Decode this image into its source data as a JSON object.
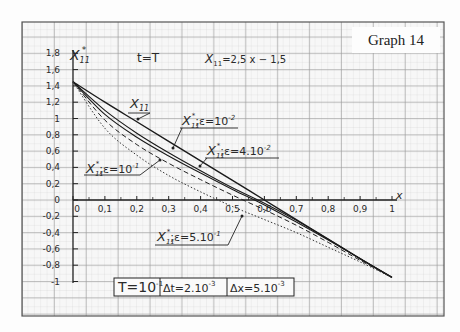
{
  "graph_label": "Graph 14",
  "chart_data": {
    "type": "line",
    "title": "t=T",
    "formula": "X11 = 2,5 x - 1,5",
    "xlabel": "x",
    "ylabel": "X*11",
    "xlim": [
      0,
      1
    ],
    "ylim": [
      -1,
      1.8
    ],
    "x_ticks": [
      "0",
      "0,1",
      "0,2",
      "0,3",
      "0,4",
      "0,5",
      "0,6",
      "0,7",
      "0,8",
      "0,9",
      "1"
    ],
    "y_ticks": [
      "1,8",
      "1,6",
      "1,4",
      "1,2",
      "1",
      "0,8",
      "0,6",
      "0,4",
      "0,2",
      "0",
      "-0,2",
      "-0,4",
      "-0,6",
      "-0,8",
      "-1"
    ],
    "grid": true,
    "x": [
      0,
      0.1,
      0.2,
      0.3,
      0.4,
      0.5,
      0.6,
      0.7,
      0.8,
      0.9,
      1.0
    ],
    "series": [
      {
        "name": "X11",
        "style": "solid-thick",
        "values": [
          1.45,
          1.2,
          0.96,
          0.72,
          0.48,
          0.24,
          0.0,
          -0.24,
          -0.48,
          -0.72,
          -0.95
        ]
      },
      {
        "name": "X*11; ε=10^-2",
        "style": "solid",
        "values": [
          1.45,
          1.1,
          0.82,
          0.58,
          0.36,
          0.15,
          -0.04,
          -0.25,
          -0.48,
          -0.72,
          -0.95
        ]
      },
      {
        "name": "X*11; ε=4·10^-2",
        "style": "solid",
        "values": [
          1.45,
          1.05,
          0.77,
          0.54,
          0.33,
          0.13,
          -0.06,
          -0.27,
          -0.49,
          -0.72,
          -0.95
        ]
      },
      {
        "name": "X*11; ε=10^-1",
        "style": "dashed",
        "values": [
          1.45,
          0.98,
          0.68,
          0.45,
          0.25,
          0.06,
          -0.12,
          -0.31,
          -0.52,
          -0.74,
          -0.95
        ]
      },
      {
        "name": "X*11; ε=5·10^-1",
        "style": "dotted",
        "values": [
          1.45,
          0.88,
          0.55,
          0.3,
          0.1,
          -0.08,
          -0.24,
          -0.4,
          -0.58,
          -0.76,
          -0.95
        ]
      }
    ],
    "annotations": [
      {
        "text": "t=T"
      },
      {
        "text": "X11 = 2,5 x - 1,5"
      },
      {
        "text": "X11"
      },
      {
        "text": "X*11; ε=10^-2"
      },
      {
        "text": "X*11; ε=4.10^-2"
      },
      {
        "text": "X*11; ε=10^-1"
      },
      {
        "text": "X*11; ε=5.10^-1"
      }
    ],
    "params_box": [
      "T=10^-1",
      "Δt=2.10^-3",
      "Δx=5.10^-3"
    ]
  },
  "labels": {
    "title": "t=T",
    "formula_lhs": "X",
    "formula_sub": "11",
    "formula_rhs": "=2,5 x − 1,5",
    "y_axis_main": "X",
    "y_axis_sup": "*",
    "y_axis_sub": "11",
    "x_axis": "x",
    "lbl_x11": "X",
    "lbl_x11_sub": "11",
    "lbl_e1": ";ε=10",
    "lbl_e1_exp": "-2",
    "lbl_e2": ";ε=4.10",
    "lbl_e2_exp": "-2",
    "lbl_e3": ";ε=10",
    "lbl_e3_exp": "-1",
    "lbl_e4": ";ε=5.10",
    "lbl_e4_exp": "-1",
    "param_T": "T=10",
    "param_T_exp": "-1",
    "param_dt": "Δt=2.10",
    "param_dt_exp": "-3",
    "param_dx": "Δx=5.10",
    "param_dx_exp": "-3"
  }
}
